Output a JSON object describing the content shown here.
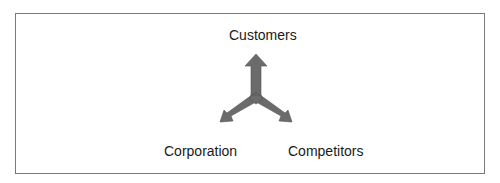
{
  "diagram": {
    "type": "three-way-arrow",
    "nodes": {
      "top": "Customers",
      "left": "Corporation",
      "right": "Competitors"
    },
    "arrow_color": "#6b6b6b",
    "border_color": "#7a7a7a"
  }
}
